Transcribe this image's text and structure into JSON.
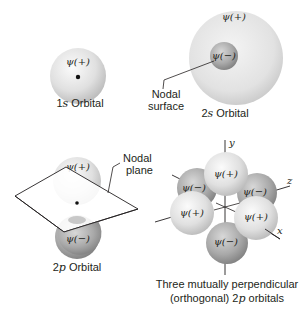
{
  "figure": {
    "colors": {
      "positive_lobe_light": "#f2f2f2",
      "positive_lobe_dark": "#bdbdbd",
      "negative_lobe_light": "#c9c9c9",
      "negative_lobe_dark": "#8a8a8a",
      "line": "#231f20"
    }
  },
  "orbital_1s": {
    "phase_label": "ψ(+)",
    "caption_prefix": "1",
    "caption_italic": "s",
    "caption_suffix": " Orbital"
  },
  "orbital_2s": {
    "outer_phase_label": "ψ(+)",
    "inner_phase_label": "ψ(−)",
    "annotation_line1": "Nodal",
    "annotation_line2": "surface",
    "caption_prefix": "2",
    "caption_italic": "s",
    "caption_suffix": " Orbital"
  },
  "orbital_2p": {
    "upper_phase_label": "ψ(+)",
    "lower_phase_label": "ψ(−)",
    "annotation_line1": "Nodal",
    "annotation_line2": "plane",
    "caption_prefix": "2",
    "caption_italic": "p",
    "caption_suffix": " Orbital"
  },
  "orbitals_3d": {
    "axes": {
      "y": "y",
      "z": "z",
      "x": "x"
    },
    "lobes": [
      {
        "name": "py-positive",
        "label": "ψ(+)"
      },
      {
        "name": "pz-negative-back",
        "label": "ψ(−)"
      },
      {
        "name": "pz-negative",
        "label": "ψ(−)"
      },
      {
        "name": "px-positive-left",
        "label": "ψ(+)"
      },
      {
        "name": "px-positive-right",
        "label": "ψ(+)"
      },
      {
        "name": "py-negative",
        "label": "ψ(−)"
      }
    ],
    "caption_line1": "Three mutually perpendicular",
    "caption_line2_prefix": "(orthogonal) 2",
    "caption_line2_italic": "p",
    "caption_line2_suffix": " orbitals"
  }
}
